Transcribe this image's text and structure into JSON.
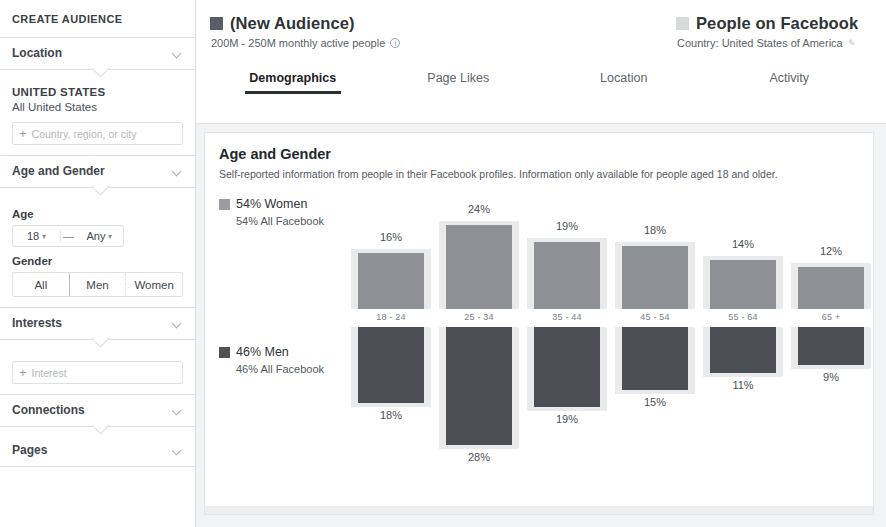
{
  "sidebar": {
    "title": "CREATE AUDIENCE",
    "sections": {
      "location": {
        "label": "Location",
        "country_heading": "UNITED STATES",
        "country_sub": "All United States",
        "input_placeholder": "Country, region, or city",
        "add_icon": "plus-icon"
      },
      "age_gender": {
        "label": "Age and Gender",
        "age_label": "Age",
        "age_min": "18",
        "age_dash": "—",
        "age_max": "Any",
        "gender_label": "Gender",
        "gender_options": [
          "All",
          "Men",
          "Women"
        ],
        "gender_selected": "All"
      },
      "interests": {
        "label": "Interests",
        "input_placeholder": "Interest",
        "add_icon": "plus-icon"
      },
      "connections": {
        "label": "Connections"
      },
      "pages": {
        "label": "Pages"
      }
    }
  },
  "header": {
    "audience": {
      "swatch_color": "#5a5f66",
      "title": "(New Audience)",
      "subtitle": "200M - 250M monthly active people",
      "info_icon": "info-icon"
    },
    "comparison": {
      "swatch_color": "#d7d9dc",
      "title": "People on Facebook",
      "subtitle": "Country: United States of America",
      "edit_icon": "pencil-icon"
    }
  },
  "tabs": [
    {
      "label": "Demographics",
      "active": true
    },
    {
      "label": "Page Likes",
      "active": false
    },
    {
      "label": "Location",
      "active": false
    },
    {
      "label": "Activity",
      "active": false
    }
  ],
  "panel": {
    "title": "Age and Gender",
    "description": "Self-reported information from people in their Facebook profiles. Information only available for people aged 18 and older.",
    "legend_women": {
      "swatch_color": "#9a9da1",
      "main": "54% Women",
      "sub": "54% All Facebook"
    },
    "legend_men": {
      "swatch_color": "#4d5157",
      "main": "46% Men",
      "sub": "46% All Facebook"
    }
  },
  "chart_data": {
    "type": "bar",
    "title": "Age and Gender",
    "xlabel": "",
    "ylabel": "",
    "orientation": "vertical-diverging",
    "categories": [
      "18 - 24",
      "25 - 34",
      "35 - 44",
      "45 - 54",
      "55 - 64",
      "65 +"
    ],
    "series": [
      {
        "name": "54% Women",
        "color": "#8d9095",
        "direction": "up",
        "values": [
          16,
          24,
          19,
          18,
          14,
          12
        ],
        "value_labels": [
          "16%",
          "24%",
          "19%",
          "18%",
          "14%",
          "12%"
        ]
      },
      {
        "name": "46% Men",
        "color": "#4b4f55",
        "direction": "down",
        "values": [
          18,
          28,
          19,
          15,
          11,
          9
        ],
        "value_labels": [
          "18%",
          "28%",
          "19%",
          "15%",
          "11%",
          "9%"
        ]
      }
    ],
    "ylim": [
      0,
      28
    ],
    "grid": false,
    "legend_position": "left"
  }
}
